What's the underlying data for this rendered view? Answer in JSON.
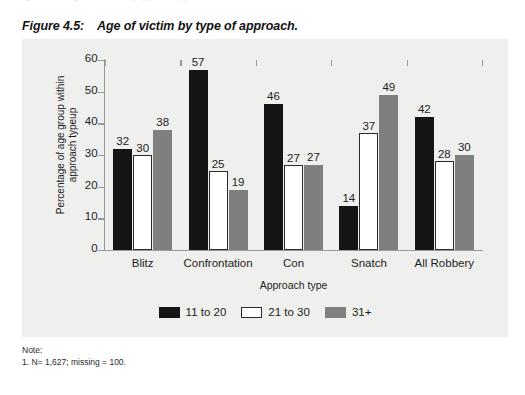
{
  "top_bleed": {
    "text": "Figure 4.4:   Age of victim by type of approach."
  },
  "caption": {
    "number": "Figure 4.5:",
    "title": "Age of victim by type of approach."
  },
  "notes": {
    "heading": "Note:",
    "line1": "1. N= 1,627; missing = 100."
  },
  "colors": {
    "series_11_to_20": "#151515",
    "series_21_to_30": "#ffffff",
    "series_31_plus": "#7f7f7f",
    "panel_background": "#efefed",
    "axis": "#9a9a9a"
  },
  "chart_data": {
    "type": "bar",
    "title": "Age of victim by type of approach.",
    "xlabel": "Approach type",
    "ylabel_line1": "Percentage of age group within",
    "ylabel_line2": "approach typeup",
    "categories": [
      "Blitz",
      "Confrontation",
      "Con",
      "Snatch",
      "All Robbery"
    ],
    "series": [
      {
        "name": "11 to 20",
        "color": "#151515",
        "values": [
          32,
          57,
          46,
          14,
          42
        ]
      },
      {
        "name": "21 to 30",
        "color": "#ffffff",
        "values": [
          30,
          25,
          27,
          37,
          28
        ]
      },
      {
        "name": "31+",
        "color": "#7f7f7f",
        "values": [
          38,
          19,
          27,
          49,
          30
        ]
      }
    ],
    "ylim": [
      0,
      60
    ],
    "yticks": [
      0,
      10,
      20,
      30,
      40,
      50,
      60
    ],
    "ytick_labels": [
      "0",
      "10",
      "20",
      "30",
      "40",
      "50",
      "60"
    ],
    "grid": false,
    "legend_position": "bottom-center",
    "data_labels": true
  }
}
